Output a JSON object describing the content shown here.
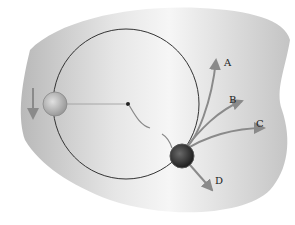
{
  "diagram": {
    "title": "",
    "labels": {
      "a": "A",
      "b": "B",
      "c": "C",
      "d": "D"
    },
    "colors": {
      "background_blob": "#c8c8c8",
      "circle_path": "#333333",
      "arrows": "#8a8a8a",
      "ball_light": "#bdbdbd",
      "ball_dark": "#2e2e2e"
    }
  }
}
